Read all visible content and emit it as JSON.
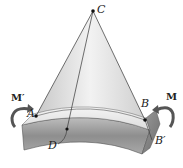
{
  "diagram": {
    "labels": {
      "C": "C",
      "A": "A",
      "B": "B",
      "B_prime": "B′",
      "D": "D",
      "M": "M",
      "M_prime": "M′"
    },
    "points": {
      "C": [
        93,
        11
      ],
      "A": [
        36,
        116
      ],
      "B": [
        145,
        120
      ],
      "D": [
        67,
        129
      ]
    },
    "colors": {
      "beam_light": "#e6e6e6",
      "beam_dark": "#8a8a8a",
      "cone_fill": "#d9d9d9",
      "line": "#333333",
      "arrow": "#555555"
    }
  }
}
